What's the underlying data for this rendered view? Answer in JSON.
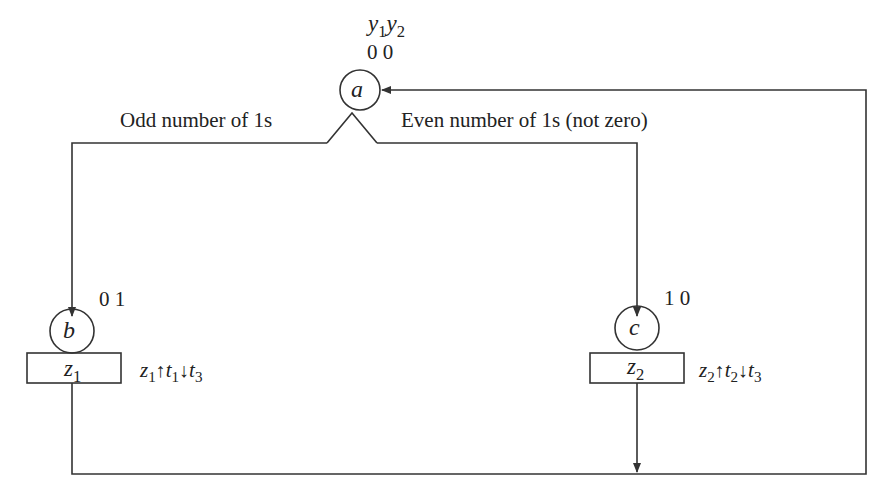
{
  "diagram": {
    "header": {
      "var1": "y",
      "var1_sub": "1",
      "var2": "y",
      "var2_sub": "2"
    },
    "states": [
      {
        "id": "a",
        "label": "a",
        "code": "0 0"
      },
      {
        "id": "b",
        "label": "b",
        "code": "0 1",
        "output": {
          "name": "z",
          "sub": "1"
        }
      },
      {
        "id": "c",
        "label": "c",
        "code": "1 0",
        "output": {
          "name": "z",
          "sub": "2"
        }
      }
    ],
    "branches": {
      "left": "Odd number of 1s",
      "right": "Even number of 1s (not zero)"
    },
    "actions": {
      "b": {
        "z": "z",
        "z_sub": "1",
        "up": "↑",
        "t_a": "t",
        "t_a_sub": "1",
        "down": "↓",
        "t_b": "t",
        "t_b_sub": "3"
      },
      "c": {
        "z": "z",
        "z_sub": "2",
        "up": "↑",
        "t_a": "t",
        "t_a_sub": "2",
        "down": "↓",
        "t_b": "t",
        "t_b_sub": "3"
      }
    },
    "colors": {
      "line": "#333333",
      "background": "#ffffff"
    }
  }
}
